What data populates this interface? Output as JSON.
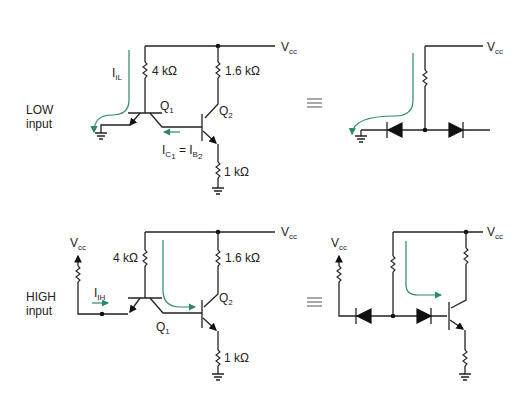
{
  "figure": {
    "top_panel": {
      "mode_label_line1": "LOW",
      "mode_label_line2": "input",
      "vcc_label": "V",
      "vcc_sub": "cc",
      "r1_label": "4 kΩ",
      "r2_label": "1.6 kΩ",
      "r3_label": "1 kΩ",
      "q1_label": "Q",
      "q1_sub": "1",
      "q2_label": "Q",
      "q2_sub": "2",
      "current_label": "I",
      "current_sub": "IL",
      "relation_lhs": "I",
      "relation_lhs_sub": "C",
      "relation_lhs_subsub": "1",
      "relation_eq": " = I",
      "relation_rhs_sub": "B",
      "relation_rhs_subsub": "2",
      "equiv_symbol": "≡",
      "equiv_vcc_label": "V",
      "equiv_vcc_sub": "cc"
    },
    "bottom_panel": {
      "mode_label_line1": "HIGH",
      "mode_label_line2": "input",
      "input_vcc_label": "V",
      "input_vcc_sub": "cc",
      "vcc_label": "V",
      "vcc_sub": "cc",
      "r1_label": "4 kΩ",
      "r2_label": "1.6 kΩ",
      "r3_label": "1 kΩ",
      "q1_label": "Q",
      "q1_sub": "1",
      "q2_label": "Q",
      "q2_sub": "2",
      "current_label": "I",
      "current_sub": "IH",
      "equiv_symbol": "≡",
      "equiv_input_vcc_label": "V",
      "equiv_input_vcc_sub": "cc",
      "equiv_vcc_label": "V",
      "equiv_vcc_sub": "cc"
    },
    "colors": {
      "wire": "#222222",
      "current_arrow": "#2a8a6a"
    }
  }
}
